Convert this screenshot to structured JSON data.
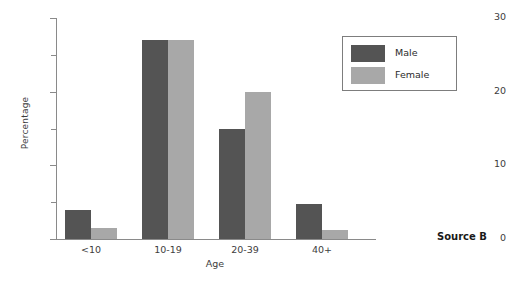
{
  "chart_data": {
    "type": "bar",
    "title": "",
    "xlabel": "Age",
    "ylabel": "Percentage",
    "categories": [
      "<10",
      "10-19",
      "20-39",
      "40+"
    ],
    "series": [
      {
        "name": "Male",
        "color": "#545454",
        "values": [
          4,
          27,
          15,
          4.7
        ]
      },
      {
        "name": "Female",
        "color": "#a8a8a8",
        "values": [
          1.5,
          27,
          20,
          1.2
        ]
      }
    ],
    "ylim": [
      0,
      30
    ],
    "yticks": [
      0,
      10,
      20,
      30
    ],
    "ytick_labels": [
      "0",
      "10",
      "20",
      "30"
    ],
    "yminor_ticks": [
      5,
      15,
      25
    ],
    "grid": false,
    "legend_position": "top-right"
  },
  "annotations": {
    "source": "Source B"
  }
}
